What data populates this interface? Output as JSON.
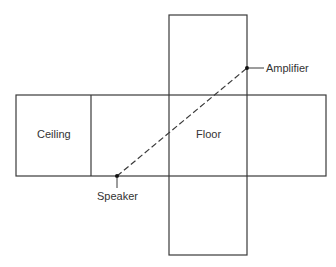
{
  "diagram": {
    "labels": {
      "ceiling": "Ceiling",
      "floor": "Floor",
      "amplifier": "Amplifier",
      "speaker": "Speaker"
    },
    "colors": {
      "line": "#3a3a3a",
      "text": "#333333",
      "background": "#ffffff"
    }
  }
}
